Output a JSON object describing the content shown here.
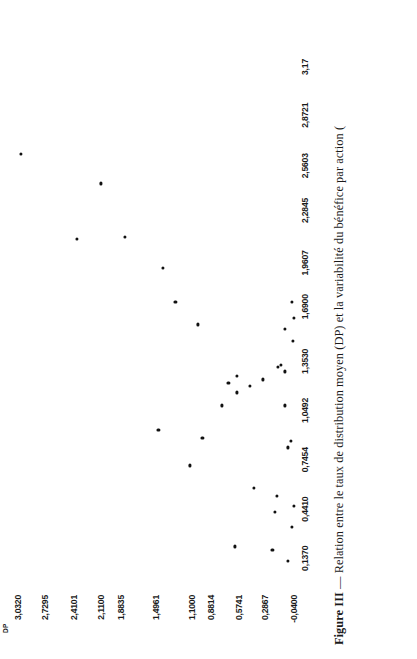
{
  "figure": {
    "caption_label": "Figure III",
    "caption_dash": "—",
    "caption_text": "Relation entre le taux de distribution moyen (DP) et la variabilité du bénéfice par action (",
    "axis_title_y": "DP"
  },
  "chart_data": {
    "type": "scatter",
    "xlabel": "",
    "ylabel": "DP",
    "grid": false,
    "legend": null,
    "xlim": [
      -0.04,
      3.17
    ],
    "ylim": [
      -0.04,
      3.032
    ],
    "xtick_labels": [
      "0,1370",
      "0,4410",
      "0,7454",
      "1,0492",
      "1,3530",
      "1,6900",
      "1,9607",
      "2,2845",
      "2,5603",
      "2,8721",
      "3,17"
    ],
    "xtick_values": [
      0.137,
      0.441,
      0.7454,
      1.0492,
      1.353,
      1.69,
      1.9607,
      2.2845,
      2.5603,
      2.8721,
      3.17
    ],
    "ytick_labels": [
      "3,0320",
      "2,7295",
      "2,4101",
      "2,1100",
      "1,8835",
      "1,4961",
      "1,1000",
      "0,8814",
      "0,5741",
      "0,2867",
      "-0,0400"
    ],
    "ytick_values": [
      3.032,
      2.7295,
      2.4101,
      2.11,
      1.8835,
      1.4961,
      1.1,
      0.8814,
      0.5741,
      0.2867,
      -0.04
    ],
    "points": [
      {
        "x": 2.63,
        "y": 3.0
      },
      {
        "x": 2.11,
        "y": 2.38
      },
      {
        "x": 2.12,
        "y": 1.84
      },
      {
        "x": 1.93,
        "y": 1.42
      },
      {
        "x": 1.72,
        "y": 1.28
      },
      {
        "x": 1.58,
        "y": 1.03
      },
      {
        "x": 2.45,
        "y": 2.11
      },
      {
        "x": 0.93,
        "y": 1.47
      },
      {
        "x": 0.88,
        "y": 0.98
      },
      {
        "x": 0.71,
        "y": 1.12
      },
      {
        "x": 1.08,
        "y": 0.76
      },
      {
        "x": 1.22,
        "y": 0.69
      },
      {
        "x": 1.26,
        "y": 0.6
      },
      {
        "x": 1.16,
        "y": 0.6
      },
      {
        "x": 1.2,
        "y": 0.45
      },
      {
        "x": 1.24,
        "y": 0.31
      },
      {
        "x": 0.57,
        "y": 0.41
      },
      {
        "x": 0.21,
        "y": 0.62
      },
      {
        "x": 0.42,
        "y": 0.17
      },
      {
        "x": 0.52,
        "y": 0.15
      },
      {
        "x": 1.33,
        "y": 0.11
      },
      {
        "x": 1.32,
        "y": 0.14
      },
      {
        "x": 1.29,
        "y": 0.06
      },
      {
        "x": 1.08,
        "y": 0.06
      },
      {
        "x": 0.82,
        "y": 0.03
      },
      {
        "x": 0.86,
        "y": -0.01
      },
      {
        "x": 1.48,
        "y": -0.03
      },
      {
        "x": 1.72,
        "y": -0.02
      },
      {
        "x": 0.12,
        "y": 0.03
      },
      {
        "x": 0.46,
        "y": -0.04
      },
      {
        "x": 0.33,
        "y": -0.02
      },
      {
        "x": 0.19,
        "y": 0.2
      },
      {
        "x": 1.55,
        "y": 0.06
      },
      {
        "x": 1.62,
        "y": -0.04
      }
    ]
  }
}
